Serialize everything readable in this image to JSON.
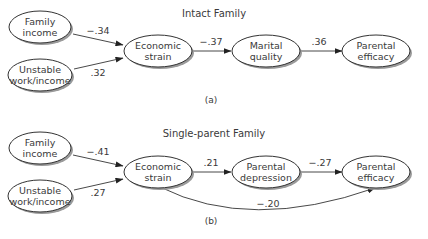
{
  "panel_a": {
    "title": "Intact Family",
    "caption": "(a)",
    "nodes": {
      "family_income": [
        "Family",
        "income"
      ],
      "unstable_work": [
        "Unstable",
        "work/income"
      ],
      "economic_strain": [
        "Economic",
        "strain"
      ],
      "marital_quality": [
        "Marital",
        "quality"
      ],
      "parental_efficacy": [
        "Parental",
        "efficacy"
      ]
    },
    "coefficients": {
      "family_income_to_strain": "−.34",
      "unstable_to_strain": ".32",
      "strain_to_marital": "−.37",
      "marital_to_efficacy": ".36"
    }
  },
  "panel_b": {
    "title": "Single-parent Family",
    "caption": "(b)",
    "nodes": {
      "family_income": [
        "Family",
        "income"
      ],
      "unstable_work": [
        "Unstable",
        "work/income"
      ],
      "economic_strain": [
        "Economic",
        "strain"
      ],
      "parental_depression": [
        "Parental",
        "depression"
      ],
      "parental_efficacy": [
        "Parental",
        "efficacy"
      ]
    },
    "coefficients": {
      "family_income_to_strain": "−.41",
      "unstable_to_strain": ".27",
      "strain_to_depression": ".21",
      "depression_to_efficacy": "−.27",
      "strain_to_efficacy": "−.20"
    }
  }
}
